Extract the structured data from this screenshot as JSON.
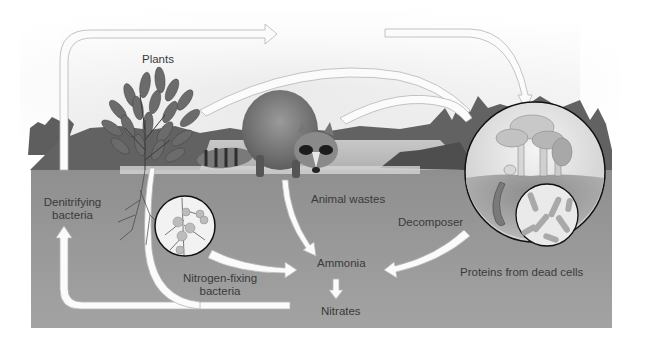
{
  "diagram": {
    "type": "nitrogen-cycle",
    "labels": {
      "plants": "Plants",
      "denitrifying_line1": "Denitrifying",
      "denitrifying_line2": "bacteria",
      "animal_wastes": "Animal wastes",
      "decomposer": "Decomposer",
      "ammonia": "Ammonia",
      "nitrogen_fixing_line1": "Nitrogen-fixing",
      "nitrogen_fixing_line2": "bacteria",
      "nitrates": "Nitrates",
      "proteins": "Proteins from dead cells"
    },
    "nodes": [
      "Plants",
      "Animal (raccoon)",
      "Decomposer (mushrooms)",
      "Nitrogen-fixing bacteria",
      "Ammonia",
      "Nitrates",
      "Denitrifying bacteria",
      "Proteins from dead cells",
      "Animal wastes"
    ],
    "flows": [
      {
        "from": "Denitrifying bacteria",
        "to": "Atmosphere / top",
        "via": "left vertical arrow"
      },
      {
        "from": "Top arrow",
        "to": "Decomposer"
      },
      {
        "from": "Plants",
        "to": "Decomposer"
      },
      {
        "from": "Animal",
        "to": "Decomposer"
      },
      {
        "from": "Animal wastes",
        "to": "Ammonia"
      },
      {
        "from": "Nitrogen-fixing bacteria",
        "to": "Ammonia"
      },
      {
        "from": "Decomposer",
        "to": "Ammonia"
      },
      {
        "from": "Ammonia",
        "to": "Nitrates"
      },
      {
        "from": "Nitrates",
        "to": "Plants"
      },
      {
        "from": "Nitrates",
        "to": "Denitrifying bacteria"
      }
    ],
    "colors": {
      "sky": "#ececec",
      "ground": "#9a9a9a",
      "treeline": "#5c5c5c",
      "arrow": "#fbfbfb",
      "text": "#3a3a3a"
    }
  }
}
